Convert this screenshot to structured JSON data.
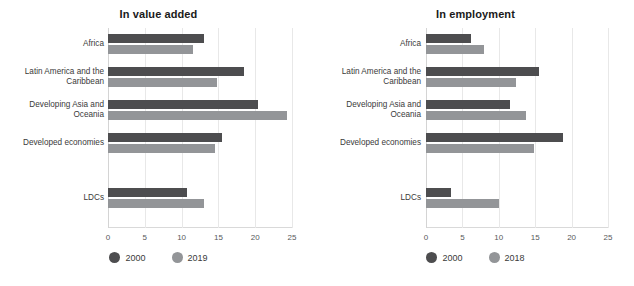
{
  "chart_data": [
    {
      "type": "bar",
      "orientation": "horizontal",
      "title": "In value added",
      "categories": [
        "Africa",
        "Latin America and the Caribbean",
        "Developing Asia and Oceania",
        "Developed economies",
        "LDCs"
      ],
      "series": [
        {
          "name": "2000",
          "color": "#4d4d4f",
          "values": [
            13.0,
            18.5,
            20.4,
            15.5,
            10.8
          ]
        },
        {
          "name": "2019",
          "color": "#939598",
          "values": [
            11.6,
            14.8,
            24.3,
            14.5,
            13.0
          ]
        }
      ],
      "xlabel": "",
      "ylabel": "",
      "xlim": [
        0,
        25
      ],
      "xticks": [
        0,
        5,
        10,
        15,
        20,
        25
      ],
      "xtick_labels": [
        "0",
        "5",
        "10",
        "15",
        "20",
        "25"
      ],
      "grid": true,
      "legend_position": "bottom"
    },
    {
      "type": "bar",
      "orientation": "horizontal",
      "title": "In employment",
      "categories": [
        "Africa",
        "Latin America and the Caribbean",
        "Developing Asia and Oceania",
        "Developed economies",
        "LDCs"
      ],
      "series": [
        {
          "name": "2000",
          "color": "#4d4d4f",
          "values": [
            6.2,
            15.5,
            11.5,
            18.8,
            3.4
          ]
        },
        {
          "name": "2018",
          "color": "#939598",
          "values": [
            8.0,
            12.3,
            13.8,
            14.8,
            10.0
          ]
        }
      ],
      "xlabel": "",
      "ylabel": "",
      "xlim": [
        0,
        25
      ],
      "xticks": [
        0,
        5,
        10,
        15,
        20,
        25
      ],
      "xtick_labels": [
        "0",
        "5",
        "10",
        "15",
        "20",
        "25"
      ],
      "grid": true,
      "legend_position": "bottom"
    }
  ],
  "panels": [
    {
      "title": "In value added",
      "categories": [
        {
          "line1": "Africa",
          "line2": ""
        },
        {
          "line1": "Latin America and the",
          "line2": "Caribbean"
        },
        {
          "line1": "Developing Asia and",
          "line2": "Oceania"
        },
        {
          "line1": "Developed economies",
          "line2": ""
        },
        {
          "line1": "LDCs",
          "line2": ""
        }
      ],
      "ticks": [
        "0",
        "5",
        "10",
        "15",
        "20",
        "25"
      ],
      "legend": [
        {
          "label": "2000",
          "color": "#4d4d4f"
        },
        {
          "label": "2019",
          "color": "#939598"
        }
      ]
    },
    {
      "title": "In employment",
      "categories": [
        {
          "line1": "Africa",
          "line2": ""
        },
        {
          "line1": "Latin America and the",
          "line2": "Caribbean"
        },
        {
          "line1": "Developing Asia and",
          "line2": "Oceania"
        },
        {
          "line1": "Developed economies",
          "line2": ""
        },
        {
          "line1": "LDCs",
          "line2": ""
        }
      ],
      "ticks": [
        "0",
        "5",
        "10",
        "15",
        "20",
        "25"
      ],
      "legend": [
        {
          "label": "2000",
          "color": "#4d4d4f"
        },
        {
          "label": "2018",
          "color": "#939598"
        }
      ]
    }
  ]
}
